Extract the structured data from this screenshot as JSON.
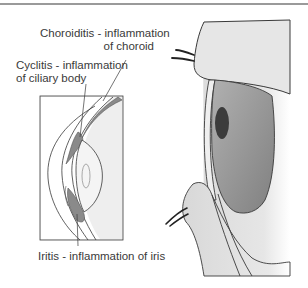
{
  "diagram": {
    "title_rule": true,
    "labels": {
      "choroiditis": {
        "line1": "Choroiditis - inflammation",
        "line2": "of choroid"
      },
      "cyclitis": {
        "line1": "Cyclitis - inflammation",
        "line2": "of ciliary body"
      },
      "iritis": {
        "line1": "Iritis - inflammation of iris"
      }
    },
    "colors": {
      "line": "#3a3a3a",
      "inflamed_tissue": "#8a8a8a",
      "skin": "#e4e4e4",
      "iris": "#9a9a9a",
      "pupil": "#3c3c3c",
      "inset_bg": "#eeeeee"
    }
  }
}
